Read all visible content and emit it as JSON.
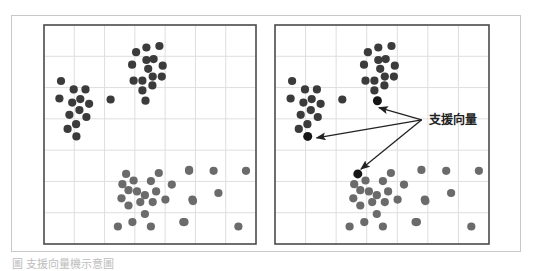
{
  "figure": {
    "caption": "圖 支援向量機示意圖",
    "colors": {
      "class_a": "#3b3b3b",
      "class_b": "#6b6b6b",
      "support_vector": "#161616",
      "grid": "#dedede",
      "border": "#4a4a4a",
      "arrow": "#222222"
    }
  },
  "chart_data": [
    {
      "type": "scatter",
      "title": "",
      "panel": "left",
      "grid": true,
      "grid_cells": [
        7,
        7
      ],
      "xlim": [
        0,
        7
      ],
      "ylim": [
        0,
        7
      ],
      "series": [
        {
          "name": "cluster-top",
          "class": "class_a",
          "points": [
            [
              3.04,
              6.13
            ],
            [
              3.38,
              6.28
            ],
            [
              3.81,
              6.33
            ],
            [
              3.38,
              5.88
            ],
            [
              3.62,
              5.91
            ],
            [
              2.91,
              5.73
            ],
            [
              3.44,
              5.6
            ],
            [
              3.92,
              5.7
            ],
            [
              3.59,
              5.35
            ],
            [
              3.89,
              5.35
            ],
            [
              2.96,
              5.22
            ],
            [
              3.25,
              5.22
            ],
            [
              3.58,
              5.07
            ],
            [
              3.25,
              4.91
            ],
            [
              3.35,
              4.58
            ]
          ]
        },
        {
          "name": "cluster-left",
          "class": "class_a",
          "points": [
            [
              0.56,
              5.21
            ],
            [
              0.98,
              4.94
            ],
            [
              1.37,
              4.94
            ],
            [
              0.51,
              4.65
            ],
            [
              0.93,
              4.52
            ],
            [
              1.2,
              4.63
            ],
            [
              1.49,
              4.48
            ],
            [
              2.2,
              4.62
            ],
            [
              1.17,
              4.28
            ],
            [
              0.84,
              4.13
            ],
            [
              1.4,
              4.06
            ],
            [
              1.06,
              3.83
            ],
            [
              0.78,
              3.68
            ],
            [
              1.07,
              3.44
            ]
          ]
        },
        {
          "name": "cluster-bottom",
          "class": "class_b",
          "points": [
            [
              2.71,
              2.24
            ],
            [
              3.79,
              2.27
            ],
            [
              4.79,
              2.37
            ],
            [
              2.96,
              2.03
            ],
            [
              3.53,
              2.01
            ],
            [
              2.59,
              1.91
            ],
            [
              4.22,
              1.9
            ],
            [
              2.79,
              1.72
            ],
            [
              3.07,
              1.68
            ],
            [
              3.7,
              1.68
            ],
            [
              3.33,
              1.56
            ],
            [
              2.56,
              1.46
            ],
            [
              3.18,
              1.34
            ],
            [
              3.59,
              1.34
            ],
            [
              4.01,
              1.42
            ],
            [
              4.9,
              1.42
            ],
            [
              2.79,
              1.23
            ],
            [
              3.33,
              0.96
            ],
            [
              2.92,
              0.7
            ],
            [
              4.6,
              0.7
            ],
            [
              2.44,
              0.56
            ],
            [
              3.53,
              0.56
            ],
            [
              4.79,
              2.34
            ],
            [
              5.6,
              2.34
            ],
            [
              6.67,
              2.34
            ],
            [
              5.76,
              1.63
            ],
            [
              4.92,
              1.37
            ],
            [
              4.64,
              0.7
            ],
            [
              6.42,
              0.56
            ]
          ]
        }
      ]
    },
    {
      "type": "scatter",
      "title": "",
      "panel": "right",
      "grid": true,
      "grid_cells": [
        7,
        7
      ],
      "xlim": [
        0,
        7
      ],
      "ylim": [
        0,
        7
      ],
      "series": [
        {
          "name": "cluster-top",
          "class": "class_a",
          "points": [
            [
              3.04,
              6.13
            ],
            [
              3.38,
              6.28
            ],
            [
              3.81,
              6.33
            ],
            [
              3.38,
              5.88
            ],
            [
              3.62,
              5.91
            ],
            [
              2.91,
              5.73
            ],
            [
              3.44,
              5.6
            ],
            [
              3.92,
              5.7
            ],
            [
              3.59,
              5.35
            ],
            [
              3.89,
              5.35
            ],
            [
              2.96,
              5.22
            ],
            [
              3.25,
              5.22
            ],
            [
              3.58,
              5.07
            ],
            [
              3.25,
              4.91
            ]
          ]
        },
        {
          "name": "cluster-left",
          "class": "class_a",
          "points": [
            [
              0.56,
              5.21
            ],
            [
              0.98,
              4.94
            ],
            [
              1.37,
              4.94
            ],
            [
              0.51,
              4.65
            ],
            [
              0.93,
              4.52
            ],
            [
              1.2,
              4.63
            ],
            [
              1.49,
              4.48
            ],
            [
              2.2,
              4.62
            ],
            [
              1.17,
              4.28
            ],
            [
              0.84,
              4.13
            ],
            [
              1.4,
              4.06
            ],
            [
              1.06,
              3.83
            ],
            [
              0.78,
              3.68
            ]
          ]
        },
        {
          "name": "cluster-bottom",
          "class": "class_b",
          "points": [
            [
              3.79,
              2.27
            ],
            [
              4.79,
              2.37
            ],
            [
              2.96,
              2.03
            ],
            [
              3.53,
              2.01
            ],
            [
              2.59,
              1.91
            ],
            [
              4.22,
              1.9
            ],
            [
              2.79,
              1.72
            ],
            [
              3.07,
              1.68
            ],
            [
              3.7,
              1.68
            ],
            [
              3.33,
              1.56
            ],
            [
              2.56,
              1.46
            ],
            [
              3.18,
              1.34
            ],
            [
              3.59,
              1.34
            ],
            [
              4.01,
              1.42
            ],
            [
              4.9,
              1.42
            ],
            [
              2.79,
              1.23
            ],
            [
              3.33,
              0.96
            ],
            [
              2.92,
              0.7
            ],
            [
              4.6,
              0.7
            ],
            [
              2.44,
              0.56
            ],
            [
              3.53,
              0.56
            ],
            [
              5.6,
              2.34
            ],
            [
              6.67,
              2.34
            ],
            [
              5.76,
              1.63
            ],
            [
              4.92,
              1.37
            ],
            [
              4.64,
              0.7
            ],
            [
              6.42,
              0.56
            ]
          ]
        },
        {
          "name": "support-vectors",
          "class": "support_vector",
          "points": [
            [
              3.35,
              4.58
            ],
            [
              1.07,
              3.44
            ],
            [
              2.71,
              2.24
            ]
          ]
        }
      ],
      "annotations": [
        {
          "text": "支援向量",
          "anchor": [
            4.8,
            3.97
          ],
          "arrows_to": [
            [
              3.4,
              4.36
            ],
            [
              1.36,
              3.39
            ],
            [
              2.81,
              2.39
            ]
          ]
        }
      ]
    }
  ]
}
